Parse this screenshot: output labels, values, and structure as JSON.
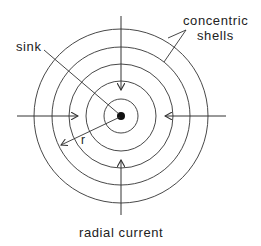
{
  "diagram": {
    "labels": {
      "sink": "sink",
      "concentric_line1": "concentric",
      "concentric_line2": "shells",
      "radius": "r",
      "radial_current": "radial current"
    },
    "geometry": {
      "center": [
        121,
        116
      ],
      "shell_radii": [
        17,
        35,
        52,
        69,
        87
      ],
      "sink_dot_radius": 4
    },
    "colors": {
      "line": "#333333",
      "text": "#222222",
      "background": "#ffffff"
    }
  }
}
